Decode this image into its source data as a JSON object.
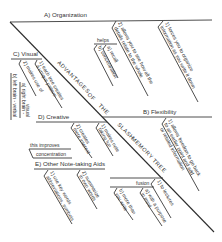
{
  "title": "ADVANTAGES OF THE SLASH MEMORY TREE",
  "spine_words": [
    "ADVANTAGES",
    "OF",
    "THE",
    "SLASH",
    "MEMORY",
    "TREE"
  ],
  "colors": {
    "line": "#3a3a3a",
    "text": "#333333",
    "background": "#ffffff"
  },
  "branches": {
    "organization": {
      "label": "A) Organization",
      "items": [
        {
          "line1": "1) forces you to organize",
          "line2": "information as you write it down"
        },
        {
          "line1": "2) allows you to see how all the",
          "line2": "details relate to the whole"
        }
      ],
      "sub": {
        "label": "helps",
        "items": [
          "a) recall",
          "b) concentration"
        ]
      }
    },
    "visual": {
      "label": "C) Visual",
      "items": [
        {
          "line1": "1) each tree creates",
          "line2": "a unique pattern"
        },
        {
          "line1": "2) makes use of",
          "line2": ""
        },
        {
          "line1": "a) right brain -",
          "line2": ""
        },
        {
          "line1": "b) left brain - verbal",
          "line2": "visual"
        }
      ]
    },
    "flexibility": {
      "label": "B) Flexibility",
      "items": [
        {
          "line1": "1) allows freedom to go back",
          "line2": "to an earlier point and add"
        },
        {
          "line1": "or related information",
          "line2": ""
        }
      ]
    },
    "creative": {
      "label": "D) Creative",
      "items": [
        {
          "line1": "1) makes note",
          "line2": "taking fun"
        },
        {
          "line1": "2) creates",
          "line2": "more interest"
        }
      ],
      "sub": {
        "label1": "this improves",
        "label2": "concentration"
      }
    },
    "other": {
      "label": "E) Other Note-taking Aids",
      "items": [
        {
          "line1": "1) use key words",
          "line2": "abbreviations, symbols"
        },
        {
          "line1": "2) summarize",
          "line2": "in own words"
        }
      ]
    },
    "fusion": {
      "label": "fusion",
      "items": [
        {
          "line1": "1) to lectures",
          "line2": ""
        },
        {
          "line1": "a) with a purpose",
          "line2": "in mind"
        },
        {
          "line1": "b) more than",
          "line2": "you write"
        }
      ]
    }
  }
}
